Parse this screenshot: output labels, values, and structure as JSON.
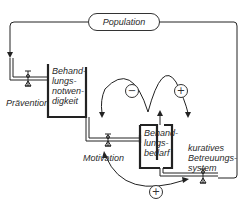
{
  "diagram": {
    "population": "Population",
    "prevention": "Prävention",
    "need_stock": "Behand-\nlungs-\nnotwen-\ndigkeit",
    "motivation": "Motivation",
    "demand_stock": "Behand-\nlungs-\nbedarf",
    "care_system": "kuratives\nBetreuungs-\nsystem",
    "loop_minus": "−",
    "loop_plus_top": "+",
    "loop_plus_bottom": "+"
  }
}
